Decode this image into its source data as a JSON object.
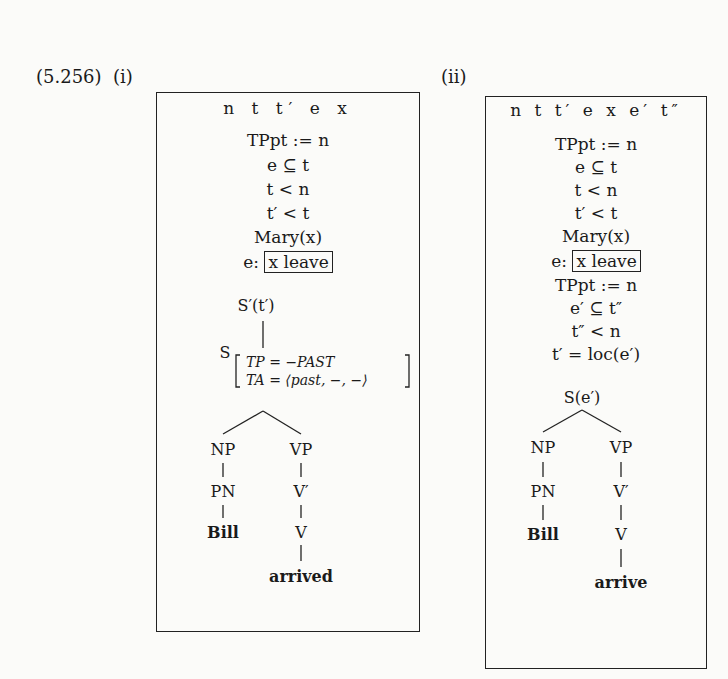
{
  "example": {
    "number": "(5.256)",
    "sub_i": "(i)",
    "sub_ii": "(ii)"
  },
  "drs_i": {
    "universe": "n t t′ e x",
    "conditions": [
      "TPpt := n",
      "e ⊆ t",
      "t < n",
      "t′ < t",
      "Mary(x)"
    ],
    "event_label": "e:",
    "event_box": "x leave",
    "tree": {
      "root": "S′(t′)",
      "s_node": "S",
      "features": [
        "TP = −PAST",
        "TA = ⟨past, −, −⟩"
      ],
      "np": "NP",
      "vp": "VP",
      "pn": "PN",
      "vbar": "V′",
      "name": "Bill",
      "v": "V",
      "verb": "arrived"
    }
  },
  "drs_ii": {
    "universe": "n t t′ e x e′ t″",
    "conditions": [
      "TPpt := n",
      "e ⊆ t",
      "t < n",
      "t′ < t",
      "Mary(x)"
    ],
    "event_label": "e:",
    "event_box": "x leave",
    "conditions_2": [
      "TPpt := n",
      "e′ ⊆ t″",
      "t″ < n",
      "t′ = loc(e′)"
    ],
    "tree": {
      "root": "S(e′)",
      "np": "NP",
      "vp": "VP",
      "pn": "PN",
      "vbar": "V′",
      "name": "Bill",
      "v": "V",
      "verb": "arrive"
    }
  }
}
